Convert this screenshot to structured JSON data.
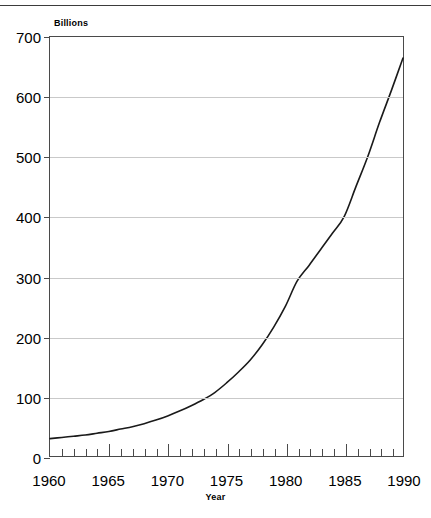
{
  "chart_data": {
    "type": "line",
    "title": "",
    "unit_label": "Billions",
    "xlabel": "Year",
    "ylabel": "",
    "xlim": [
      1960,
      1990
    ],
    "ylim": [
      0,
      700
    ],
    "grid": true,
    "legend": null,
    "y_ticks": [
      0,
      100,
      200,
      300,
      400,
      500,
      600,
      700
    ],
    "y_tick_labels": [
      "0",
      "100",
      "200",
      "300",
      "400",
      "500",
      "600",
      "700"
    ],
    "x_ticks": [
      1960,
      1965,
      1970,
      1975,
      1980,
      1985,
      1990
    ],
    "x_tick_labels": [
      "1960",
      "1965",
      "1970",
      "1975",
      "1980",
      "1985",
      "1990"
    ],
    "x_minor_tick_step": 1,
    "series": [
      {
        "name": "",
        "color": "#1a1a1a",
        "x": [
          1960,
          1961,
          1962,
          1963,
          1964,
          1965,
          1966,
          1967,
          1968,
          1969,
          1970,
          1971,
          1972,
          1973,
          1974,
          1975,
          1976,
          1977,
          1978,
          1979,
          1980,
          1981,
          1982,
          1983,
          1984,
          1985,
          1986,
          1987,
          1988,
          1989,
          1990
        ],
        "values": [
          29,
          31,
          33,
          35,
          38,
          41,
          45,
          49,
          54,
          60,
          67,
          75,
          84,
          94,
          106,
          122,
          140,
          160,
          185,
          215,
          250,
          292,
          318,
          345,
          372,
          400,
          450,
          500,
          557,
          610,
          665
        ]
      }
    ]
  },
  "axes_geometry": {
    "plot_left_px": 49,
    "plot_top_px": 36,
    "plot_width_px": 355,
    "plot_height_px": 421
  }
}
